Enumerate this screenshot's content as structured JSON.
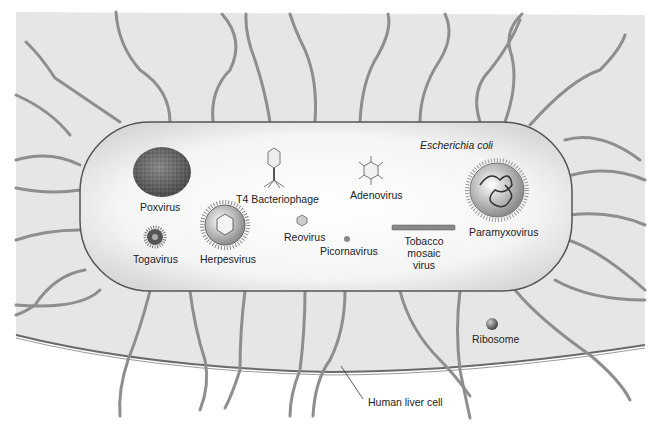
{
  "figure": {
    "colors": {
      "liver_cell_fill": "#e6e6e6",
      "ecoli_fill": "#f4f4f4",
      "outline": "#555555",
      "fiber": "#9a9a9a",
      "label": "#222222"
    },
    "host_cells": {
      "bacterium_label": "Escherichia coli",
      "liver_cell_label": "Human liver cell",
      "ribosome_label": "Ribosome"
    },
    "viruses": [
      {
        "name": "Poxvirus",
        "shape": "textured-ovoid"
      },
      {
        "name": "T4 Bacteriophage",
        "shape": "head-tail-phage"
      },
      {
        "name": "Adenovirus",
        "shape": "icosahedron-with-fibers"
      },
      {
        "name": "Paramyxovirus",
        "shape": "spiked-sphere-with-coiled-nucleocapsid"
      },
      {
        "name": "Togavirus",
        "shape": "small-spiked-sphere"
      },
      {
        "name": "Herpesvirus",
        "shape": "spiked-envelope-with-icosahedral-capsid"
      },
      {
        "name": "Reovirus",
        "shape": "small-icosahedron"
      },
      {
        "name": "Picornavirus",
        "shape": "tiny-icosahedron"
      },
      {
        "name": "Tobacco",
        "name_line2": "mosaic",
        "name_line3": "virus",
        "shape": "helical-rod"
      }
    ]
  }
}
